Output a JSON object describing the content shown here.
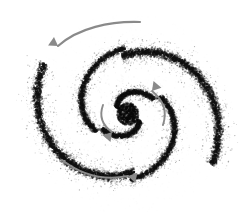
{
  "figure": {
    "title": "Spiral galaxy rotation diagram",
    "background_color": "#ffffff",
    "width": 239,
    "height": 223,
    "caption": ""
  },
  "galaxy": {
    "name": "stippled-spiral-galaxy",
    "center": {
      "x": 128,
      "y": 114
    },
    "dot_color": "#111111",
    "halo_color": "#cfcfcf",
    "core": {
      "name": "galactic-core",
      "radius": 11,
      "density": 900,
      "color": "#0a0a0a"
    },
    "halo": {
      "name": "outer-halo",
      "radius": 104,
      "density": 1500,
      "opacity": 0.22
    },
    "arms": [
      {
        "name": "outer-arm-upper-right",
        "start_angle_deg": -96,
        "sweep_deg": 128,
        "r_start": 60,
        "r_end": 99,
        "thickness": 11,
        "density": 2600,
        "darkness": 1.0
      },
      {
        "name": "outer-arm-lower-left",
        "start_angle_deg": 84,
        "sweep_deg": 128,
        "r_start": 60,
        "r_end": 99,
        "thickness": 11,
        "density": 2600,
        "darkness": 1.0
      },
      {
        "name": "mid-arm-left",
        "start_angle_deg": 150,
        "sweep_deg": 118,
        "r_start": 36,
        "r_end": 68,
        "thickness": 8,
        "density": 1700,
        "darkness": 0.95
      },
      {
        "name": "mid-arm-right",
        "start_angle_deg": -30,
        "sweep_deg": 118,
        "r_start": 36,
        "r_end": 68,
        "thickness": 8,
        "density": 1700,
        "darkness": 0.95
      },
      {
        "name": "inner-arm-upper",
        "start_angle_deg": -150,
        "sweep_deg": 120,
        "r_start": 13,
        "r_end": 30,
        "thickness": 7,
        "density": 1100,
        "darkness": 1.0
      },
      {
        "name": "inner-arm-lower",
        "start_angle_deg": 30,
        "sweep_deg": 120,
        "r_start": 13,
        "r_end": 30,
        "thickness": 7,
        "density": 1100,
        "darkness": 1.0
      }
    ]
  },
  "annotations": {
    "rotation_direction": "counterclockwise",
    "arrows": [
      {
        "name": "rotation-arrow-outer-top",
        "label": "",
        "color": "#8a8a8a",
        "path": "M 140 22 C 110 21 78 28 58 46",
        "head_points": "58,46 72,42 67,54",
        "head_rotation_deg": 215
      },
      {
        "name": "rotation-arrow-outer-bottom",
        "label": "",
        "color": "#8a8a8a",
        "path": "M 62 160 C 84 177 108 180 128 176",
        "head_points": "128,176 114,170 116,182",
        "head_rotation_deg": 12
      },
      {
        "name": "rotation-arrow-inner-right",
        "label": "",
        "color": "#8a8a8a",
        "path": "M 163 125 C 168 110 162 99 152 91",
        "head_points": "152,91 160,100 149,101",
        "head_rotation_deg": 310
      },
      {
        "name": "rotation-arrow-inner-left",
        "label": "",
        "color": "#8a8a8a",
        "path": "M 103 105 C 99 116 102 125 112 132",
        "head_points": "112,132 103,126 112,121",
        "head_rotation_deg": 130
      }
    ]
  }
}
